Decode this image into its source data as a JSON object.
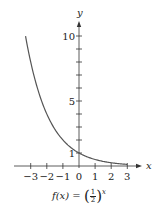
{
  "chart_data": {
    "type": "line",
    "formula": {
      "lhs": "f(x) =",
      "base_numerator": "1",
      "base_denominator": "2",
      "exponent": "x"
    },
    "xlabel": "x",
    "ylabel": "y",
    "xlim": [
      -4,
      3.8
    ],
    "ylim": [
      0,
      11
    ],
    "x_ticks": [
      -3,
      -2,
      -1,
      0,
      1,
      2,
      3
    ],
    "x_tick_labels": [
      "−3",
      "−2",
      "−1",
      "0",
      "1",
      "2",
      "3"
    ],
    "y_ticks": [
      1,
      2,
      3,
      4,
      5,
      6,
      7,
      8,
      9,
      10
    ],
    "y_tick_labels": [
      {
        "value": 1,
        "label": "1"
      },
      {
        "value": 5,
        "label": "5"
      },
      {
        "value": 10,
        "label": "10"
      }
    ],
    "series": [
      {
        "name": "f(x) = (1/2)^x",
        "function": "0.5^x",
        "x_range": [
          -3.32,
          3
        ]
      }
    ],
    "grid": false,
    "color": "#555555"
  }
}
